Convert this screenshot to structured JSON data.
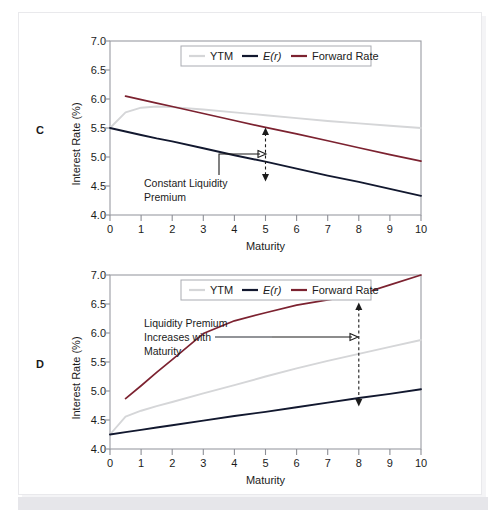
{
  "figure": {
    "background_color": "#ffffff",
    "panels": [
      {
        "letter": "C",
        "annotation_lines": [
          "Constant Liquidity",
          "Premium"
        ],
        "arrow_at_maturity": 5
      },
      {
        "letter": "D",
        "annotation_lines": [
          "Liquidity Premium",
          "Increases with",
          "Maturity"
        ],
        "arrow_at_maturity": 8
      }
    ]
  },
  "legend": {
    "position": "top-center",
    "entries": [
      {
        "label": "YTM",
        "color": "#d5d6d8",
        "italic": false
      },
      {
        "label": "E(r)",
        "color": "#12182f",
        "italic": true
      },
      {
        "label": "Forward Rate",
        "color": "#7c2230",
        "italic": false
      }
    ]
  },
  "axes": {
    "xlabel": "Maturity",
    "ylabel": "Interest Rate (%)",
    "xticks": [
      "0",
      "1",
      "2",
      "3",
      "4",
      "5",
      "6",
      "7",
      "8",
      "9",
      "10"
    ],
    "yticks": [
      "7.0",
      "6.5",
      "6.0",
      "5.5",
      "5.0",
      "4.5",
      "4.0"
    ],
    "xlim": [
      0,
      10
    ],
    "ylim": [
      4.0,
      7.0
    ]
  },
  "chart_data": [
    {
      "type": "line",
      "panel": "C",
      "title": "",
      "subtitle": "Declining expected short rates with constant liquidity premium",
      "xlabel": "Maturity",
      "ylabel": "Interest Rate (%)",
      "xlim": [
        0,
        10
      ],
      "ylim": [
        4.0,
        7.0
      ],
      "xticks": [
        0,
        1,
        2,
        3,
        4,
        5,
        6,
        7,
        8,
        9,
        10
      ],
      "yticks": [
        4.0,
        4.5,
        5.0,
        5.5,
        6.0,
        6.5,
        7.0
      ],
      "grid": false,
      "legend_position": "top-center",
      "x": [
        0,
        0.5,
        1,
        1.5,
        2,
        3,
        4,
        5,
        6,
        7,
        8,
        9,
        10
      ],
      "series": [
        {
          "name": "YTM",
          "color": "#d5d6d8",
          "values": [
            5.5,
            5.77,
            5.85,
            5.87,
            5.86,
            5.82,
            5.77,
            5.72,
            5.67,
            5.62,
            5.58,
            5.54,
            5.5
          ]
        },
        {
          "name": "E(r)",
          "color": "#12182f",
          "values": [
            5.5,
            5.44,
            5.38,
            5.32,
            5.27,
            5.15,
            5.03,
            4.92,
            4.8,
            4.68,
            4.57,
            4.45,
            4.33
          ]
        },
        {
          "name": "Forward Rate",
          "color": "#7c2230",
          "x_start": 0.5,
          "values": [
            null,
            6.05,
            5.99,
            5.93,
            5.87,
            5.75,
            5.63,
            5.51,
            5.4,
            5.28,
            5.16,
            5.04,
            4.93
          ]
        }
      ],
      "annotations": [
        {
          "text": "Constant Liquidity Premium",
          "lines": [
            "Constant Liquidity",
            "Premium"
          ],
          "leader_to_maturity": 5,
          "arrow_type": "double-headed-dashed-vertical",
          "arrow_x": 5,
          "arrow_y_top": 5.51,
          "arrow_y_bottom": 4.92,
          "gap_value": 0.59
        }
      ]
    },
    {
      "type": "line",
      "panel": "D",
      "title": "",
      "subtitle": "Rising expected short rates with liquidity premium increasing in maturity",
      "xlabel": "Maturity",
      "ylabel": "Interest Rate (%)",
      "xlim": [
        0,
        10
      ],
      "ylim": [
        4.0,
        7.0
      ],
      "xticks": [
        0,
        1,
        2,
        3,
        4,
        5,
        6,
        7,
        8,
        9,
        10
      ],
      "yticks": [
        4.0,
        4.5,
        5.0,
        5.5,
        6.0,
        6.5,
        7.0
      ],
      "grid": false,
      "legend_position": "top-center",
      "x": [
        0,
        0.5,
        1,
        1.5,
        2,
        3,
        4,
        5,
        6,
        7,
        8,
        9,
        10
      ],
      "series": [
        {
          "name": "YTM",
          "color": "#d5d6d8",
          "values": [
            4.25,
            4.56,
            4.66,
            4.74,
            4.81,
            4.96,
            5.1,
            5.25,
            5.39,
            5.52,
            5.64,
            5.76,
            5.88
          ]
        },
        {
          "name": "E(r)",
          "color": "#12182f",
          "values": [
            4.25,
            4.29,
            4.33,
            4.37,
            4.41,
            4.49,
            4.57,
            4.64,
            4.72,
            4.8,
            4.88,
            4.95,
            5.03
          ]
        },
        {
          "name": "Forward Rate",
          "color": "#7c2230",
          "x_start": 0.5,
          "values": [
            null,
            4.87,
            5.09,
            5.32,
            5.54,
            5.99,
            6.21,
            6.35,
            6.48,
            6.57,
            6.66,
            6.83,
            7.0
          ]
        }
      ],
      "annotations": [
        {
          "text": "Liquidity Premium Increases with Maturity",
          "lines": [
            "Liquidity Premium",
            "Increases with",
            "Maturity"
          ],
          "leader_to_maturity": 8,
          "arrow_type": "double-headed-dashed-vertical",
          "arrow_x": 8,
          "arrow_y_top": 6.56,
          "arrow_y_bottom": 4.88,
          "gap_value": 1.68
        }
      ]
    }
  ]
}
